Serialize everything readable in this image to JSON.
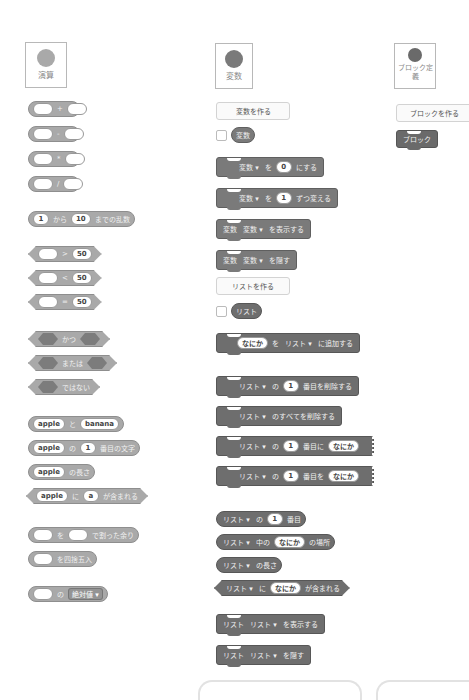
{
  "categories": {
    "operators": {
      "label": "演算",
      "color": "#a9a9a9"
    },
    "variables": {
      "label": "変数",
      "color": "#7a7a7a"
    },
    "my_blocks": {
      "label": "ブロック定義",
      "label_line1": "ブロック定",
      "label_line2": "義",
      "color": "#6a6a6a"
    }
  },
  "operators": {
    "arith": [
      "+",
      "-",
      "*",
      "/"
    ],
    "random": {
      "from": "1",
      "text1": "から",
      "to": "10",
      "text2": "までの乱数"
    },
    "compare": [
      {
        "op": ">",
        "value": "50"
      },
      {
        "op": "<",
        "value": "50"
      },
      {
        "op": "=",
        "value": "50"
      }
    ],
    "logic": {
      "and": "かつ",
      "or": "または",
      "not": "ではない"
    },
    "join": {
      "a": "apple",
      "text": "と",
      "b": "banana"
    },
    "letter": {
      "word": "apple",
      "text1": "の",
      "index": "1",
      "text2": "番目の文字"
    },
    "length": {
      "word": "apple",
      "text": "の長さ"
    },
    "contains": {
      "word": "apple",
      "text1": "に",
      "letter": "a",
      "text2": "が含まれる"
    },
    "mod": {
      "text1": "を",
      "text2": "で割った余り"
    },
    "round": {
      "text": "を四捨五入"
    },
    "mathop": {
      "text": "の",
      "fn": "絶対値"
    }
  },
  "variables": {
    "make_variable": "変数を作る",
    "variable_name": "変数",
    "set": {
      "var": "変数",
      "text1": "を",
      "value": "0",
      "text2": "にする"
    },
    "change": {
      "var": "変数",
      "text1": "を",
      "value": "1",
      "text2": "ずつ変える"
    },
    "show": {
      "prefix": "変数",
      "var": "変数",
      "text": "を表示する"
    },
    "hide": {
      "prefix": "変数",
      "var": "変数",
      "text": "を隠す"
    },
    "make_list": "リストを作る",
    "list_name": "リスト",
    "list_add": {
      "item": "なにか",
      "text1": "を",
      "list": "リスト",
      "text2": "に追加する"
    },
    "list_delete": {
      "list": "リスト",
      "text1": "の",
      "index": "1",
      "text2": "番目を削除する"
    },
    "list_delete_all": {
      "list": "リスト",
      "text": "のすべてを削除する"
    },
    "list_insert": {
      "list": "リスト",
      "text1": "の",
      "index": "1",
      "text2": "番目に",
      "item": "なにか"
    },
    "list_replace": {
      "list": "リスト",
      "text1": "の",
      "index": "1",
      "text2": "番目を",
      "item": "なにか"
    },
    "list_item": {
      "list": "リスト",
      "text1": "の",
      "index": "1",
      "text2": "番目"
    },
    "list_index_of": {
      "list": "リスト",
      "text1": "中の",
      "item": "なにか",
      "text2": "の場所"
    },
    "list_length": {
      "list": "リスト",
      "text": "の長さ"
    },
    "list_contains": {
      "list": "リスト",
      "text1": "に",
      "item": "なにか",
      "text2": "が含まれる"
    },
    "list_show": {
      "prefix": "リスト",
      "list": "リスト",
      "text": "を表示する"
    },
    "list_hide": {
      "prefix": "リスト",
      "list": "リスト",
      "text": "を隠す"
    }
  },
  "my_blocks": {
    "make_block": "ブロックを作る",
    "block_label": "ブロック"
  },
  "dropdown_arrow": "▾"
}
